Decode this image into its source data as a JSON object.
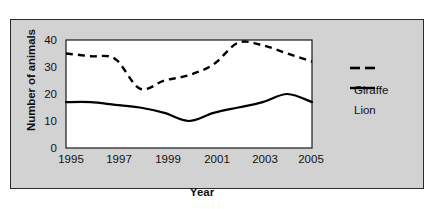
{
  "chart_data": {
    "type": "line",
    "title": "",
    "xlabel": "Year",
    "ylabel": "Number of animals",
    "xlim": [
      1995,
      2005
    ],
    "ylim": [
      0,
      40
    ],
    "grid": false,
    "legend_position": "right",
    "xticks": [
      "1995",
      "1997",
      "1999",
      "2001",
      "2003",
      "2005"
    ],
    "yticks": [
      "0",
      "10",
      "20",
      "30",
      "40"
    ],
    "x": [
      1995,
      1996,
      1997,
      1998,
      1999,
      2000,
      2001,
      2002,
      2003,
      2004,
      2005
    ],
    "series": [
      {
        "name": "Giraffe",
        "style": "dashed",
        "color": "#000000",
        "values": [
          35,
          34,
          33,
          22,
          25,
          27,
          31,
          39,
          38,
          35,
          32
        ]
      },
      {
        "name": "Lion",
        "style": "solid",
        "color": "#000000",
        "values": [
          17,
          17,
          16,
          15,
          13,
          10,
          13,
          15,
          17,
          20,
          17
        ]
      }
    ]
  },
  "legend": {
    "items": [
      {
        "label": "Giraffe",
        "style": "dashed"
      },
      {
        "label": "Lion",
        "style": "solid"
      }
    ]
  },
  "colors": {
    "panel_background": "#d2d2d2",
    "plot_background": "#ffffff",
    "line": "#000000",
    "border": "#2a2a2a"
  }
}
